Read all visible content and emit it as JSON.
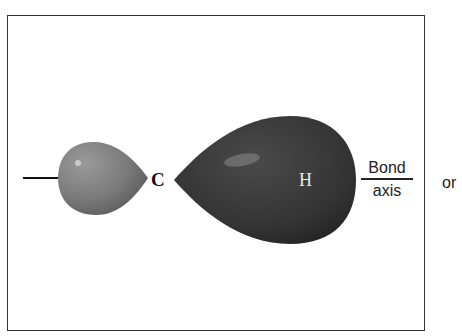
{
  "diagram": {
    "atoms": {
      "carbon": "C",
      "hydrogen": "H"
    },
    "axis_label": {
      "top": "Bond",
      "bottom": "axis"
    },
    "trailing_text": "or",
    "lobes": [
      {
        "name": "small-lobe",
        "color": "#7a7a7a"
      },
      {
        "name": "large-lobe",
        "color": "#3a3a3a"
      }
    ]
  }
}
